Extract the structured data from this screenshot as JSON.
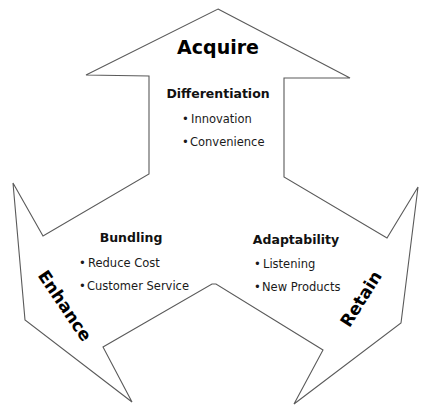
{
  "diagram": {
    "colors": {
      "outline": "#5a5a5a",
      "text": "#000000",
      "background": "#ffffff"
    },
    "arrows": [
      {
        "id": "acquire",
        "label": "Acquire",
        "direction": "up",
        "section": {
          "title": "Differentiation",
          "bullets": [
            "Innovation",
            "Convenience"
          ]
        }
      },
      {
        "id": "enhance",
        "label": "Enhance",
        "direction": "down-left",
        "section": {
          "title": "Bundling",
          "bullets": [
            "Reduce Cost",
            "Customer Service"
          ]
        }
      },
      {
        "id": "retain",
        "label": "Retain",
        "direction": "down-right",
        "section": {
          "title": "Adaptability",
          "bullets": [
            "Listening",
            "New Products"
          ]
        }
      }
    ],
    "bullet_glyph": "•"
  }
}
